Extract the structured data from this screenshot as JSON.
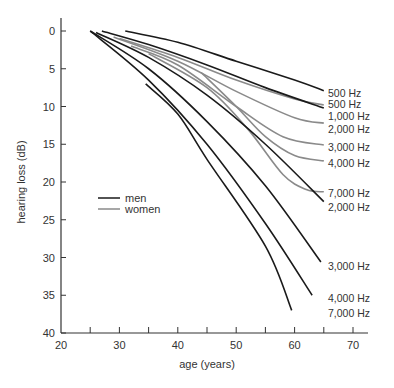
{
  "chart_data": {
    "type": "line",
    "title": "",
    "xlabel": "age (years)",
    "ylabel": "hearing loss (dB)",
    "xlim": [
      20,
      70
    ],
    "ylim": [
      0,
      40
    ],
    "y_inverted": true,
    "grid": false,
    "x_ticks": [
      20,
      25,
      30,
      35,
      40,
      45,
      50,
      55,
      60,
      65,
      70
    ],
    "x_tick_labels": [
      "20",
      "30",
      "40",
      "50",
      "60",
      "70"
    ],
    "y_tick_labels": [
      "0",
      "5",
      "10",
      "15",
      "20",
      "25",
      "30",
      "35",
      "40"
    ],
    "legend": {
      "position": "upper-left-inside",
      "entries": [
        {
          "label": "men",
          "color": "#1a1a1a"
        },
        {
          "label": "women",
          "color": "#8a8a8a"
        }
      ]
    },
    "series": [
      {
        "name": "men 500 Hz",
        "group": "men",
        "label": "500 Hz",
        "points": [
          [
            31,
            0
          ],
          [
            40,
            1.5
          ],
          [
            50,
            4
          ],
          [
            60,
            6.5
          ],
          [
            65,
            7.9
          ]
        ]
      },
      {
        "name": "women 500 Hz",
        "group": "women",
        "label": "500 Hz",
        "points": [
          [
            30,
            1
          ],
          [
            40,
            3.5
          ],
          [
            50,
            6.5
          ],
          [
            60,
            9
          ],
          [
            65,
            9.8
          ]
        ]
      },
      {
        "name": "men 1,000 Hz",
        "group": "men",
        "label": "1,000 Hz",
        "points": [
          [
            27,
            0
          ],
          [
            35,
            1.8
          ],
          [
            45,
            4.5
          ],
          [
            55,
            7.5
          ],
          [
            65,
            10.2
          ]
        ]
      },
      {
        "name": "women 2,000 Hz",
        "group": "women",
        "label": "2,000 Hz",
        "points": [
          [
            29,
            0.8
          ],
          [
            40,
            4
          ],
          [
            50,
            8
          ],
          [
            60,
            11.5
          ],
          [
            65,
            12.2
          ]
        ]
      },
      {
        "name": "women 3,000 Hz",
        "group": "women",
        "label": "3,000 Hz",
        "points": [
          [
            32,
            2
          ],
          [
            40,
            4.5
          ],
          [
            50,
            10
          ],
          [
            58,
            14
          ],
          [
            65,
            15.1
          ]
        ]
      },
      {
        "name": "women 4,000 Hz",
        "group": "women",
        "label": "4,000 Hz",
        "points": [
          [
            44,
            5.5
          ],
          [
            50,
            10
          ],
          [
            55,
            14
          ],
          [
            60,
            16.5
          ],
          [
            65,
            17.2
          ]
        ]
      },
      {
        "name": "women 7,000 Hz",
        "group": "women",
        "label": "7,000 Hz",
        "points": [
          [
            35,
            3
          ],
          [
            45,
            7.5
          ],
          [
            52,
            13
          ],
          [
            58,
            19
          ],
          [
            62,
            21
          ],
          [
            65,
            21.3
          ]
        ]
      },
      {
        "name": "men 2,000 Hz",
        "group": "men",
        "label": "2,000 Hz",
        "points": [
          [
            26,
            0.2
          ],
          [
            35,
            3.5
          ],
          [
            45,
            8.5
          ],
          [
            55,
            15
          ],
          [
            65,
            22.6
          ]
        ]
      },
      {
        "name": "men 3,000 Hz",
        "group": "men",
        "label": "3,000 Hz",
        "points": [
          [
            25,
            0
          ],
          [
            35,
            5
          ],
          [
            45,
            12
          ],
          [
            55,
            20.5
          ],
          [
            64.5,
            30.6
          ]
        ]
      },
      {
        "name": "men 4,000 Hz",
        "group": "men",
        "label": "4,000 Hz",
        "points": [
          [
            25,
            0
          ],
          [
            35,
            6.5
          ],
          [
            45,
            15
          ],
          [
            55,
            25.5
          ],
          [
            63,
            35
          ]
        ]
      },
      {
        "name": "men 7,000 Hz",
        "group": "men",
        "label": "7,000 Hz",
        "points": [
          [
            34.5,
            7
          ],
          [
            40,
            11
          ],
          [
            45,
            17
          ],
          [
            55,
            28.5
          ],
          [
            59.5,
            37
          ]
        ]
      }
    ],
    "right_labels": [
      {
        "text": "500 Hz",
        "y_px": 93
      },
      {
        "text": "500 Hz",
        "y_px": 104
      },
      {
        "text": "1,000 Hz",
        "y_px": 116
      },
      {
        "text": "2,000 Hz",
        "y_px": 129
      },
      {
        "text": "3,000 Hz",
        "y_px": 147
      },
      {
        "text": "4,000 Hz",
        "y_px": 163
      },
      {
        "text": "7,000 Hz",
        "y_px": 193
      },
      {
        "text": "2,000 Hz",
        "y_px": 207
      },
      {
        "text": "3,000 Hz",
        "y_px": 266
      },
      {
        "text": "4,000 Hz",
        "y_px": 298
      },
      {
        "text": "7,000 Hz",
        "y_px": 313
      }
    ],
    "colors": {
      "men": "#1a1a1a",
      "women": "#8a8a8a",
      "axis": "#333333"
    }
  }
}
